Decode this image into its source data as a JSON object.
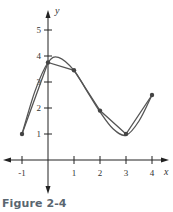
{
  "chart_data": {
    "type": "line",
    "title": "",
    "caption": "Figure 2-4",
    "xlabel": "x",
    "ylabel": "y",
    "xlim": [
      -1.5,
      4.7
    ],
    "ylim": [
      -1.2,
      5.8
    ],
    "grid": false,
    "legend": null,
    "x_ticks": [
      -1,
      1,
      2,
      3,
      4
    ],
    "x_tick_labels": [
      "-1",
      "1",
      "2",
      "3",
      "4"
    ],
    "y_ticks": [
      1,
      2,
      3,
      4,
      5
    ],
    "y_tick_labels": [
      "1",
      "2",
      "3",
      "4",
      "5"
    ],
    "series": [
      {
        "name": "data points (polygonal line)",
        "style": "straight segments with dot markers",
        "x": [
          -1,
          0,
          1,
          2,
          3,
          4
        ],
        "y": [
          1.0,
          3.75,
          3.45,
          1.9,
          1.0,
          2.5
        ]
      },
      {
        "name": "smooth interpolating curve",
        "style": "smooth curve through the same points",
        "x": [
          -1,
          -0.5,
          0,
          0.4,
          1,
          1.5,
          2,
          2.5,
          3,
          3.5,
          4
        ],
        "y": [
          1.0,
          2.65,
          3.75,
          3.95,
          3.45,
          2.65,
          1.85,
          1.2,
          0.95,
          1.5,
          2.5
        ]
      }
    ]
  },
  "figure": {
    "caption": "Figure 2-4",
    "x_axis_label": "x",
    "y_axis_label": "y",
    "colors": {
      "curve": "#555555",
      "axis": "#222222",
      "caption": "#5a6670"
    }
  }
}
